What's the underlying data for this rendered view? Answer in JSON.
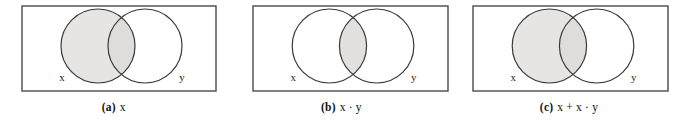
{
  "figure": {
    "type": "venn-diagram-set",
    "panel_count": 3,
    "colors": {
      "shade": "#e6e5e3",
      "shade_overlap": "#dedddb",
      "stroke": "#3a3a3a",
      "box_stroke": "#4a4a4a",
      "background": "#ffffff",
      "text": "#111111"
    }
  },
  "panels": [
    {
      "id": "a",
      "caption_label": "(a)",
      "caption_expr": "x",
      "shaded_region": "x",
      "left_circle_label": "x",
      "right_circle_label": "y"
    },
    {
      "id": "b",
      "caption_label": "(b)",
      "caption_expr": "x · y",
      "shaded_region": "x-and-y-intersection",
      "left_circle_label": "x",
      "right_circle_label": "y"
    },
    {
      "id": "c",
      "caption_label": "(c)",
      "caption_expr": "x + x · y",
      "shaded_region": "x",
      "left_circle_label": "x",
      "right_circle_label": "y"
    }
  ]
}
